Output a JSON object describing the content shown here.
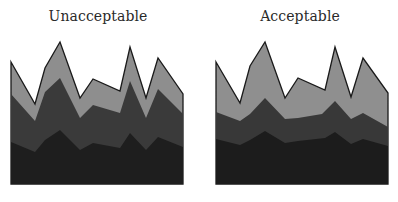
{
  "chart_data": [
    {
      "type": "area",
      "title": "Unacceptable",
      "stacked": true,
      "x": [
        0,
        1,
        2,
        3,
        4,
        5,
        6,
        7,
        8,
        9,
        10
      ],
      "series": [
        {
          "name": "bottom",
          "color": "#1e1e1e",
          "values": [
            42,
            32,
            44,
            54,
            34,
            41,
            36,
            51,
            34,
            47,
            37
          ]
        },
        {
          "name": "middle",
          "color": "#3a3a3a",
          "values": [
            48,
            31,
            48,
            52,
            32,
            38,
            35,
            52,
            32,
            48,
            33
          ]
        },
        {
          "name": "top",
          "color": "#8e8e8e",
          "values": [
            32,
            17,
            24,
            36,
            20,
            26,
            22,
            34,
            21,
            31,
            20
          ]
        }
      ],
      "xlabel": "",
      "ylabel": "",
      "grid": false,
      "polygons_px": {
        "top": [
          [
            11,
            62
          ],
          [
            35,
            104
          ],
          [
            45,
            68
          ],
          [
            60,
            42
          ],
          [
            80,
            98
          ],
          [
            93,
            79
          ],
          [
            120,
            91
          ],
          [
            130,
            47
          ],
          [
            146,
            98
          ],
          [
            158,
            58
          ],
          [
            183,
            94
          ]
        ],
        "middle": [
          [
            11,
            94
          ],
          [
            35,
            121
          ],
          [
            45,
            92
          ],
          [
            60,
            78
          ],
          [
            80,
            118
          ],
          [
            93,
            105
          ],
          [
            120,
            113
          ],
          [
            130,
            81
          ],
          [
            146,
            118
          ],
          [
            158,
            89
          ],
          [
            183,
            114
          ]
        ],
        "bottom": [
          [
            11,
            142
          ],
          [
            35,
            152
          ],
          [
            45,
            140
          ],
          [
            60,
            130
          ],
          [
            80,
            150
          ],
          [
            93,
            143
          ],
          [
            120,
            148
          ],
          [
            130,
            133
          ],
          [
            146,
            150
          ],
          [
            158,
            137
          ],
          [
            183,
            147
          ]
        ],
        "baseline": 184
      }
    },
    {
      "type": "area",
      "title": "Acceptable",
      "stacked": true,
      "x": [
        0,
        1,
        2,
        3,
        4,
        5,
        6,
        7,
        8,
        9,
        10
      ],
      "series": [
        {
          "name": "bottom",
          "color": "#1c1c1c",
          "values": [
            45,
            39,
            46,
            53,
            41,
            43,
            46,
            52,
            40,
            45,
            38
          ]
        },
        {
          "name": "middle",
          "color": "#383838",
          "values": [
            27,
            24,
            29,
            33,
            24,
            23,
            24,
            31,
            25,
            26,
            19
          ]
        },
        {
          "name": "top",
          "color": "#8f8f8f",
          "values": [
            50,
            18,
            48,
            56,
            21,
            40,
            24,
            54,
            22,
            55,
            34
          ]
        }
      ],
      "xlabel": "",
      "ylabel": "",
      "grid": false,
      "polygons_px": {
        "top": [
          [
            216,
            62
          ],
          [
            240,
            103
          ],
          [
            250,
            66
          ],
          [
            265,
            42
          ],
          [
            285,
            98
          ],
          [
            298,
            78
          ],
          [
            325,
            90
          ],
          [
            335,
            47
          ],
          [
            351,
            97
          ],
          [
            363,
            58
          ],
          [
            388,
            93
          ]
        ],
        "middle": [
          [
            216,
            112
          ],
          [
            240,
            121
          ],
          [
            250,
            114
          ],
          [
            265,
            98
          ],
          [
            285,
            119
          ],
          [
            298,
            118
          ],
          [
            322,
            114
          ],
          [
            335,
            101
          ],
          [
            351,
            119
          ],
          [
            363,
            113
          ],
          [
            388,
            127
          ]
        ],
        "bottom": [
          [
            216,
            139
          ],
          [
            240,
            145
          ],
          [
            250,
            140
          ],
          [
            265,
            131
          ],
          [
            285,
            143
          ],
          [
            298,
            141
          ],
          [
            325,
            138
          ],
          [
            335,
            132
          ],
          [
            351,
            144
          ],
          [
            363,
            139
          ],
          [
            388,
            146
          ]
        ],
        "baseline": 184
      }
    }
  ],
  "labels": {
    "left_title": "Unacceptable",
    "right_title": "Acceptable"
  }
}
